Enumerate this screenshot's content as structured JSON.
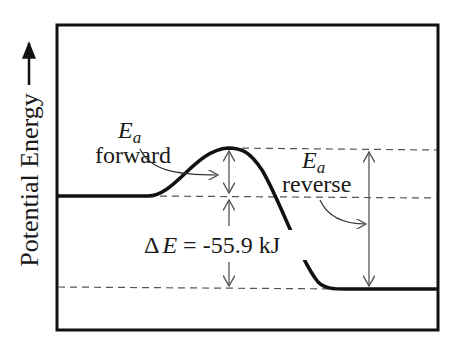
{
  "axis": {
    "ylabel": "Potential Energy",
    "arrow": "→"
  },
  "labels": {
    "ea_forward": {
      "symbol": "E",
      "subscript": "a",
      "text": "forward"
    },
    "ea_reverse": {
      "symbol": "E",
      "subscript": "a",
      "text": "reverse"
    },
    "delta_e": {
      "prefix": "Δ",
      "symbol": "E",
      "value": " = -55.9 kJ"
    }
  },
  "colors": {
    "curve": "#111111",
    "frame": "#111111",
    "arrows": "#555555",
    "dashes": "#555555"
  },
  "energy_levels": {
    "reactants_y": 196,
    "transition_state_y": 148,
    "products_y": 289
  },
  "values": {
    "delta_e_kj": -55.9
  }
}
